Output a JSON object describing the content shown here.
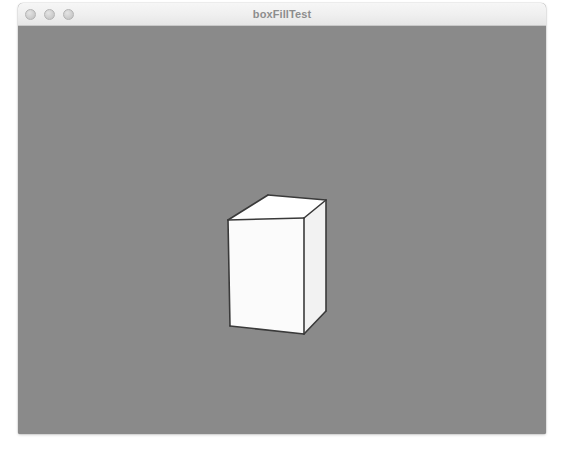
{
  "window": {
    "title": "boxFillTest",
    "traffic_lights": [
      {
        "name": "close",
        "color": "#cfcfcf"
      },
      {
        "name": "minimize",
        "color": "#cfcfcf"
      },
      {
        "name": "zoom",
        "color": "#cfcfcf"
      }
    ],
    "state": "inactive"
  },
  "canvas": {
    "background_color": "#8a8a8a",
    "width": 528,
    "height": 409
  },
  "scene": {
    "object_name": "box",
    "fill_color": "#fdfdfd",
    "top_face_color": "#ffffff",
    "front_face_color": "#fbfbfb",
    "side_face_color": "#f2f2f2",
    "stroke_color": "#3a3a3a",
    "stroke_width": 1.6,
    "faces": {
      "top": "250,169 308,174 286,192 210,194",
      "front": "210,194 286,192 286,308 212,300",
      "side": "286,192 308,174 308,285 286,308"
    },
    "edges": [
      "210,194 250,169",
      "250,169 308,174",
      "308,174 286,192",
      "286,192 210,194",
      "210,194 212,300",
      "286,192 286,308",
      "308,174 308,285",
      "212,300 286,308",
      "286,308 308,285"
    ]
  }
}
